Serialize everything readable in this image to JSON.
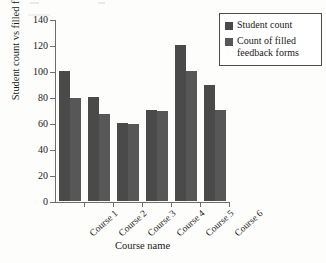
{
  "chart_data": {
    "type": "bar",
    "title": "",
    "subtitle": "",
    "xlabel": "Course name",
    "ylabel": "Student count vs filled feedback forms",
    "categories": [
      "Course 1",
      "Course 2",
      "Course 3",
      "Course 4",
      "Course 5",
      "Course 6"
    ],
    "series": [
      {
        "name": "Student count",
        "color": "#4a4a4a",
        "values": [
          100,
          80,
          60,
          70,
          120,
          89
        ]
      },
      {
        "name": "Count of filled feedback forms",
        "color": "#575757",
        "values": [
          79,
          67,
          59,
          69,
          100,
          70
        ]
      }
    ],
    "ylim": [
      0,
      140
    ],
    "yticks": [
      0,
      20,
      40,
      60,
      80,
      100,
      120,
      140
    ],
    "ytick_labels": [
      "0",
      "20",
      "40",
      "60",
      "80",
      "100",
      "120",
      "140"
    ],
    "grid": false,
    "legend_position": "top-right",
    "xtick_rotation": -42
  },
  "legend": {
    "entries": [
      {
        "label": "Student count"
      },
      {
        "label": "Count of filled feedback forms"
      }
    ]
  }
}
